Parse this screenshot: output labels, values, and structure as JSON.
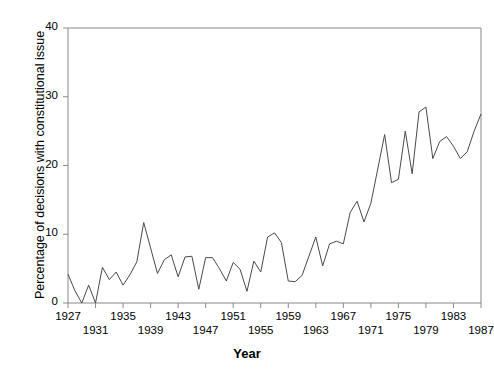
{
  "chart_data": {
    "type": "line",
    "title": "",
    "xlabel": "Year",
    "ylabel": "Percentage of decisions with constitutional issue",
    "xlim": [
      1927,
      1987
    ],
    "ylim": [
      0,
      40
    ],
    "grid": false,
    "legend": "none",
    "yticks": [
      0,
      10,
      20,
      30,
      40
    ],
    "ytick_labels": [
      "0",
      "10",
      "20",
      "30",
      "40"
    ],
    "xticks": [
      1927,
      1931,
      1935,
      1939,
      1943,
      1947,
      1951,
      1955,
      1959,
      1963,
      1967,
      1971,
      1975,
      1979,
      1983,
      1987
    ],
    "xtick_labels": [
      "1927",
      "1931",
      "1935",
      "1939",
      "1943",
      "1947",
      "1951",
      "1955",
      "1959",
      "1963",
      "1967",
      "1971",
      "1975",
      "1979",
      "1983",
      "1987"
    ],
    "xtick_label_stagger": true,
    "line_color": "#404040",
    "x": [
      1927,
      1928,
      1929,
      1930,
      1931,
      1932,
      1933,
      1934,
      1935,
      1936,
      1937,
      1938,
      1939,
      1940,
      1941,
      1942,
      1943,
      1944,
      1945,
      1946,
      1947,
      1948,
      1949,
      1950,
      1951,
      1952,
      1953,
      1954,
      1955,
      1956,
      1957,
      1958,
      1959,
      1960,
      1961,
      1962,
      1963,
      1964,
      1965,
      1966,
      1967,
      1968,
      1969,
      1970,
      1971,
      1972,
      1973,
      1974,
      1975,
      1976,
      1977,
      1978,
      1979,
      1980,
      1981,
      1982,
      1983,
      1984,
      1985,
      1986,
      1987
    ],
    "values": [
      4.2,
      1.8,
      0.0,
      2.6,
      0.0,
      5.2,
      3.4,
      4.5,
      2.6,
      4.1,
      6.0,
      11.7,
      8.0,
      4.3,
      6.3,
      7.0,
      3.8,
      6.7,
      6.8,
      2.0,
      6.6,
      6.6,
      5.0,
      3.2,
      5.9,
      4.9,
      1.7,
      6.1,
      4.5,
      9.6,
      10.2,
      8.8,
      3.2,
      3.1,
      4.0,
      6.8,
      9.6,
      5.4,
      8.6,
      9.0,
      8.6,
      13.2,
      14.8,
      11.8,
      14.5,
      19.5,
      24.5,
      17.5,
      18.0,
      25.0,
      18.8,
      27.8,
      28.5,
      21.0,
      23.5,
      24.2,
      22.8,
      21.0,
      22.0,
      25.0,
      27.5
    ],
    "series": [
      {
        "name": "Percentage of decisions with constitutional issue",
        "values": [
          4.2,
          1.8,
          0.0,
          2.6,
          0.0,
          5.2,
          3.4,
          4.5,
          2.6,
          4.1,
          6.0,
          11.7,
          8.0,
          4.3,
          6.3,
          7.0,
          3.8,
          6.7,
          6.8,
          2.0,
          6.6,
          6.6,
          5.0,
          3.2,
          5.9,
          4.9,
          1.7,
          6.1,
          4.5,
          9.6,
          10.2,
          8.8,
          3.2,
          3.1,
          4.0,
          6.8,
          9.6,
          5.4,
          8.6,
          9.0,
          8.6,
          13.2,
          14.8,
          11.8,
          14.5,
          19.5,
          24.5,
          17.5,
          18.0,
          25.0,
          18.8,
          27.8,
          28.5,
          21.0,
          23.5,
          24.2,
          22.8,
          21.0,
          22.0,
          25.0,
          27.5
        ]
      }
    ]
  }
}
